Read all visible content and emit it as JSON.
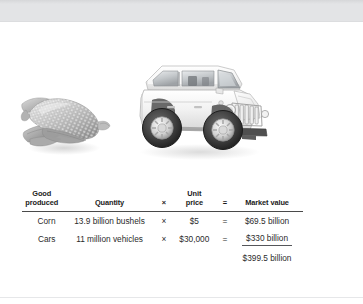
{
  "figure": {
    "images": [
      {
        "name": "corn-cob-image",
        "alt": "Ear of corn with husk, grayscale photograph"
      },
      {
        "name": "jeep-vehicle-image",
        "alt": "White Jeep Wrangler sport utility vehicle, grayscale photograph"
      }
    ]
  },
  "table": {
    "headers": [
      "Good\nproduced",
      "Quantity",
      "×",
      "Unit\nprice",
      "=",
      "Market value"
    ],
    "headers_plain": {
      "good_produced_line1": "Good",
      "good_produced_line2": "produced",
      "quantity": "Quantity",
      "multiply_symbol": "×",
      "unit_price_line1": "Unit",
      "unit_price_line2": "price",
      "equals_symbol": "=",
      "market_value": "Market value"
    },
    "rows": [
      {
        "good": "Corn",
        "quantity": "13.9 billion bushels",
        "op_multiply": "×",
        "unit_price": "$5",
        "op_equals": "=",
        "market_value": "$69.5 billion"
      },
      {
        "good": "Cars",
        "quantity": "11 million vehicles",
        "op_multiply": "×",
        "unit_price": "$30,000",
        "op_equals": "=",
        "market_value": "$330 billion"
      }
    ],
    "total": "$399.5 billion"
  }
}
